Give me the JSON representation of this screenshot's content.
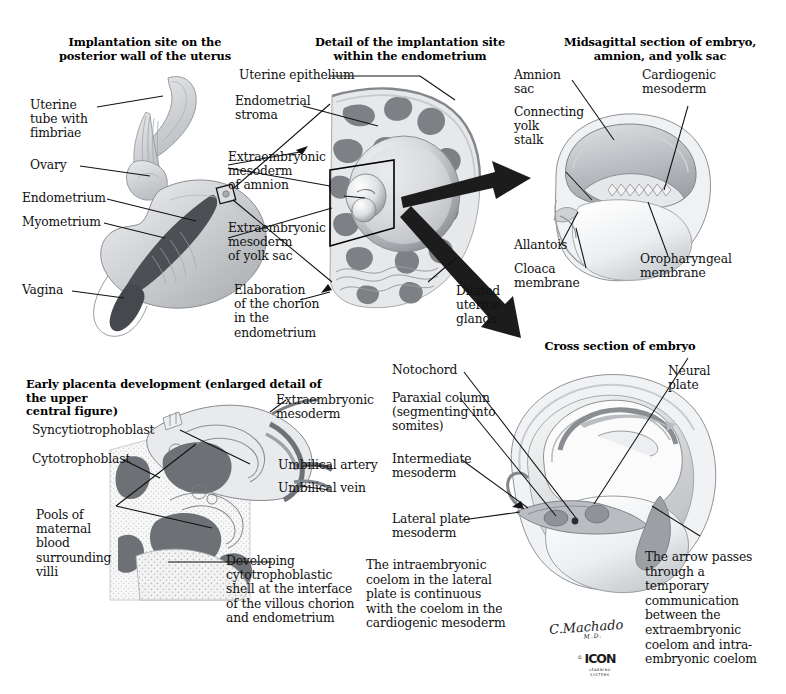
{
  "plate": {
    "artist_signature": "C.Machado",
    "artist_credential": "M.D.",
    "publisher_mark": "ICON",
    "publisher_sub_line1": "LEARNING",
    "publisher_sub_line2": "SYSTEMS",
    "copyright_symbol": "©"
  },
  "panels": [
    {
      "id": "implantation-site",
      "title": "Implantation site on the\nposterior wall of the uterus",
      "labels": [
        "Uterine\ntube with\nfimbriae",
        "Ovary",
        "Endometrium",
        "Myometrium",
        "Vagina"
      ]
    },
    {
      "id": "implantation-detail",
      "title": "Detail of the implantation site\nwithin the endometrium",
      "labels": [
        "Uterine epithelium",
        "Endometrial\nstroma",
        "Extraembryonic\nmesoderm\nof amnion",
        "Extraembryonic\nmesoderm\nof yolk sac",
        "Elaboration\nof the chorion\nin the endometrium",
        "Dilated\nuterine\nglands"
      ]
    },
    {
      "id": "midsagittal-embryo",
      "title": "Midsagittal section of embryo,\namnion, and yolk sac",
      "labels": [
        "Amnion\nsac",
        "Connecting\nyolk\nstalk",
        "Cardiogenic\nmesoderm",
        "Allantois",
        "Cloaca\nmembrane",
        "Oropharyngeal\nmembrane"
      ]
    },
    {
      "id": "early-placenta",
      "title": "Early placenta development (enlarged detail of the upper\ncentral figure)",
      "labels": [
        "Syncytiotrophoblast",
        "Cytotrophoblast",
        "Pools of\nmaternal\nblood\nsurrounding\nvilli",
        "Extraembryonic\nmesoderm",
        "Umbilical artery",
        "Umbilical vein",
        "Developing\ncytotrophoblastic\nshell at the interface\nof the villous chorion\nand endometrium"
      ]
    },
    {
      "id": "cross-section-embryo",
      "title": "Cross section of embryo",
      "labels": [
        "Notochord",
        "Paraxial column\n(segmenting into\nsomites)",
        "Intermediate\nmesoderm",
        "Lateral plate\nmesoderm",
        "Neural\nplate"
      ],
      "notes": [
        "The intraembryonic\ncoelom in the lateral\nplate is continuous\nwith the coelom in the\ncardiogenic mesoderm",
        "The arrow passes\nthrough a temporary\ncommunication\nbetween the\nextraembryonic\ncoelom and intra-\nembryonic coelom"
      ]
    }
  ],
  "colors": {
    "ink": "#111111",
    "background": "#ffffff",
    "arrow": "#1c1c1c",
    "tissue_dark": "#6f7277",
    "tissue_mid": "#a9acb1",
    "tissue_light": "#d9dbde",
    "tissue_pale": "#efeff0"
  }
}
